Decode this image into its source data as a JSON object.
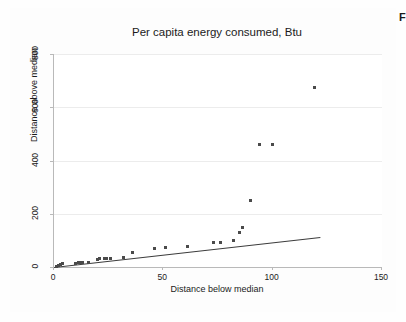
{
  "page": {
    "background_color": "#ffffff",
    "corner_fragment_text": "F"
  },
  "chart_data": {
    "type": "scatter",
    "title": "Per capita energy consumed, Btu",
    "xlabel": "Distance below median",
    "ylabel": "Distance above median",
    "xlim": [
      0,
      150
    ],
    "ylim": [
      0,
      800
    ],
    "xticks": [
      0,
      50,
      100,
      150
    ],
    "yticks": [
      0,
      200,
      400,
      600,
      800
    ],
    "xtick_labels": [
      "0",
      "50",
      "100",
      "150"
    ],
    "ytick_labels": [
      "0",
      "200",
      "400",
      "600",
      "800"
    ],
    "grid": "horizontal",
    "legend": "none",
    "marker_color": "#4a4a4a",
    "reference_line_color": "#3c3c3c",
    "gridline_color": "#ececec",
    "axis_color": "#b9b9b9",
    "points": [
      {
        "x": 1,
        "y": 3
      },
      {
        "x": 2,
        "y": 6
      },
      {
        "x": 3,
        "y": 10
      },
      {
        "x": 4,
        "y": 12
      },
      {
        "x": 10,
        "y": 14
      },
      {
        "x": 11,
        "y": 16
      },
      {
        "x": 12,
        "y": 16
      },
      {
        "x": 13,
        "y": 17
      },
      {
        "x": 16,
        "y": 18
      },
      {
        "x": 20,
        "y": 30
      },
      {
        "x": 21,
        "y": 31
      },
      {
        "x": 23,
        "y": 32
      },
      {
        "x": 24,
        "y": 33
      },
      {
        "x": 26,
        "y": 32
      },
      {
        "x": 32,
        "y": 36
      },
      {
        "x": 36,
        "y": 56
      },
      {
        "x": 46,
        "y": 70
      },
      {
        "x": 51,
        "y": 72
      },
      {
        "x": 61,
        "y": 76
      },
      {
        "x": 73,
        "y": 93
      },
      {
        "x": 76,
        "y": 93
      },
      {
        "x": 82,
        "y": 100
      },
      {
        "x": 85,
        "y": 128
      },
      {
        "x": 86,
        "y": 150
      },
      {
        "x": 90,
        "y": 248
      },
      {
        "x": 94,
        "y": 460
      },
      {
        "x": 100,
        "y": 460
      },
      {
        "x": 119,
        "y": 673
      }
    ],
    "reference_line": {
      "x_start": 0,
      "y_start": 0,
      "x_end": 122,
      "y_end": 113
    }
  }
}
